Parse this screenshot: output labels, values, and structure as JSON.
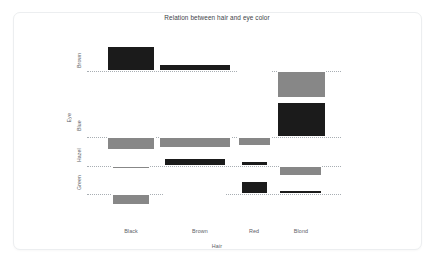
{
  "card": {
    "background": "#ffffff",
    "border_color": "#eceef0"
  },
  "chart_data": {
    "type": "bar",
    "title": "Relation between hair and eye color",
    "xlabel": "Hair",
    "ylabel": "Eye",
    "grid": false,
    "legend": false,
    "note": "Association (assoc) plot of the HairEyeColor table: bar height is proportional to the Pearson residual, bar width to sqrt(expected count). Bars above the dotted baseline are positive residuals (black), bars below are negative residuals (grey).",
    "colors": {
      "positive": "#1b1b1b",
      "negative": "#878787",
      "baseline": "#9aa0a6"
    },
    "categories": [
      "Black",
      "Brown",
      "Red",
      "Blond"
    ],
    "rows": [
      "Brown",
      "Blue",
      "Hazel",
      "Green"
    ],
    "series": [
      {
        "name": "Brown",
        "values": [
          4.4,
          1.2,
          0.07,
          -5.85
        ]
      },
      {
        "name": "Blue",
        "values": [
          -3.07,
          -1.95,
          -1.73,
          7.0
        ]
      },
      {
        "name": "Hazel",
        "values": [
          -0.48,
          1.35,
          0.85,
          -2.23
        ]
      },
      {
        "name": "Green",
        "values": [
          -1.95,
          -0.35,
          2.28,
          0.61
        ]
      }
    ],
    "bars": [
      {
        "row": "Brown",
        "col": "Black",
        "sign": "pos",
        "x": 20,
        "w": 48,
        "h": 25
      },
      {
        "row": "Brown",
        "col": "Brown",
        "sign": "pos",
        "x": 72,
        "w": 72,
        "h": 7
      },
      {
        "row": "Brown",
        "col": "Red",
        "sign": "pos",
        "x": 151,
        "w": 33,
        "h": 1
      },
      {
        "row": "Brown",
        "col": "Blond",
        "sign": "neg",
        "x": 190,
        "w": 49,
        "h": 27
      },
      {
        "row": "Blue",
        "col": "Black",
        "sign": "neg",
        "x": 20,
        "w": 48,
        "h": 13
      },
      {
        "row": "Blue",
        "col": "Brown",
        "sign": "neg",
        "x": 72,
        "w": 72,
        "h": 11
      },
      {
        "row": "Blue",
        "col": "Red",
        "sign": "neg",
        "x": 151,
        "w": 33,
        "h": 9
      },
      {
        "row": "Blue",
        "col": "Blond",
        "sign": "pos",
        "x": 190,
        "w": 49,
        "h": 35
      },
      {
        "row": "Hazel",
        "col": "Black",
        "sign": "neg",
        "x": 25,
        "w": 38,
        "h": 3
      },
      {
        "row": "Hazel",
        "col": "Brown",
        "sign": "pos",
        "x": 77,
        "w": 62,
        "h": 8
      },
      {
        "row": "Hazel",
        "col": "Red",
        "sign": "pos",
        "x": 154,
        "w": 27,
        "h": 5
      },
      {
        "row": "Hazel",
        "col": "Blond",
        "sign": "neg",
        "x": 192,
        "w": 43,
        "h": 10
      },
      {
        "row": "Green",
        "col": "Black",
        "sign": "neg",
        "x": 25,
        "w": 38,
        "h": 11
      },
      {
        "row": "Green",
        "col": "Brown",
        "sign": "neg",
        "x": 77,
        "w": 62,
        "h": 2
      },
      {
        "row": "Green",
        "col": "Red",
        "sign": "pos",
        "x": 154,
        "w": 27,
        "h": 13
      },
      {
        "row": "Green",
        "col": "Blond",
        "sign": "pos",
        "x": 192,
        "w": 43,
        "h": 4
      }
    ],
    "row_baselines_px": [
      71,
      137,
      166,
      194
    ],
    "x_tick_centers_px": [
      131,
      200,
      254,
      301
    ]
  }
}
